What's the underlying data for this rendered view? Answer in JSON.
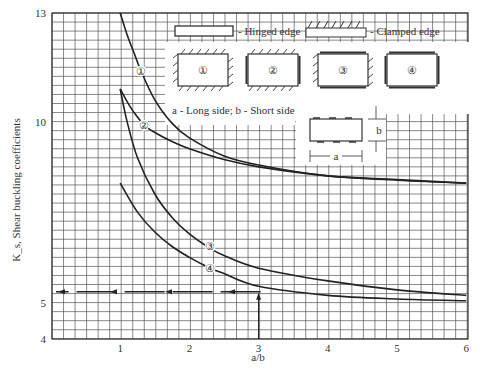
{
  "chart_data": {
    "type": "line",
    "title": "",
    "xlabel": "a/b",
    "ylabel": "K_s, Shear buckling coefficients",
    "xlim": [
      0,
      6
    ],
    "ylim": [
      4,
      13
    ],
    "x_ticks": [
      "1",
      "2",
      "3",
      "4",
      "5",
      "6"
    ],
    "y_ticks": [
      "4",
      "5",
      "10",
      "13"
    ],
    "grid": true,
    "series": [
      {
        "name": "1",
        "label": "Case 1 - all edges clamped",
        "x": [
          1.0,
          1.1,
          1.2,
          1.3,
          1.5,
          1.75,
          2.0,
          2.5,
          3.0,
          4.0,
          5.0,
          6.0
        ],
        "values": [
          13.0,
          12.4,
          11.9,
          11.4,
          10.6,
          9.95,
          9.55,
          9.05,
          8.8,
          8.5,
          8.4,
          8.3
        ]
      },
      {
        "name": "2",
        "label": "Case 2 - long edges clamped, short edges hinged",
        "x": [
          1.0,
          1.1,
          1.2,
          1.35,
          1.5,
          1.75,
          2.0,
          2.5,
          3.0,
          4.0,
          5.0,
          6.0
        ],
        "values": [
          10.9,
          10.55,
          10.25,
          9.9,
          9.7,
          9.45,
          9.25,
          8.95,
          8.75,
          8.5,
          8.38,
          8.3
        ]
      },
      {
        "name": "3",
        "label": "Case 3 - short edges clamped, long edges hinged",
        "x": [
          1.0,
          1.1,
          1.25,
          1.5,
          1.75,
          2.0,
          2.3,
          2.5,
          3.0,
          4.0,
          5.0,
          6.0
        ],
        "values": [
          10.9,
          10.0,
          9.0,
          8.0,
          7.35,
          6.9,
          6.5,
          6.3,
          5.95,
          5.6,
          5.35,
          5.2
        ]
      },
      {
        "name": "4",
        "label": "Case 4 - all edges hinged",
        "x": [
          1.0,
          1.25,
          1.5,
          1.75,
          2.0,
          2.3,
          2.5,
          3.0,
          4.0,
          5.0,
          6.0
        ],
        "values": [
          8.3,
          7.5,
          6.95,
          6.55,
          6.25,
          5.95,
          5.8,
          5.45,
          5.2,
          5.1,
          5.05
        ]
      }
    ],
    "annotations": [
      {
        "type": "dashed-line",
        "y": 5.3,
        "x_from": 0,
        "x_to": 3,
        "note": "horizontal dashed line with left-pointing arrows"
      },
      {
        "type": "arrow",
        "x": 3,
        "y_from": 4,
        "y_to": 5.3,
        "note": "vertical arrow up from a/b = 3"
      }
    ],
    "legend": {
      "hinged_edge": "- Hinged edge",
      "clamped_edge": "- Clamped edge",
      "cases": [
        "①",
        "②",
        "③",
        "④"
      ],
      "dimension_note": "a - Long side;  b - Short side",
      "dim_a": "a",
      "dim_b": "b",
      "position": "upper right, inside plot"
    }
  }
}
